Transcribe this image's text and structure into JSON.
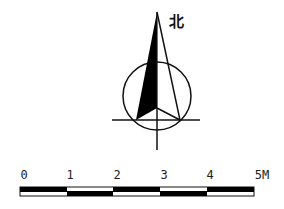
{
  "compass": {
    "north_label": "北",
    "icon": "north-arrow-icon"
  },
  "scale_bar": {
    "labels": [
      "0",
      "1",
      "2",
      "3",
      "4",
      "5M"
    ],
    "unit": "M",
    "segments": 5,
    "colors": {
      "dark": "#000000",
      "light": "#ffffff"
    }
  }
}
